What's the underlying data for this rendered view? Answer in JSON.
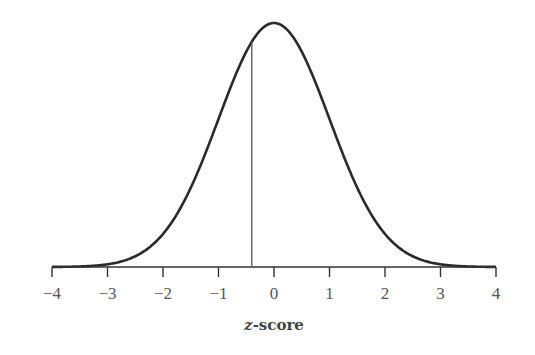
{
  "chart_data": {
    "type": "line",
    "title": "",
    "xlabel": "z-score",
    "ylabel": "",
    "xlim": [
      -4,
      4
    ],
    "x_ticks": [
      -4,
      -3,
      -2,
      -1,
      0,
      1,
      2,
      3,
      4
    ],
    "x_tick_labels": [
      "−4",
      "−3",
      "−2",
      "−1",
      "0",
      "1",
      "2",
      "3",
      "4"
    ],
    "series": [
      {
        "name": "Standard normal density",
        "function": "exp(-z^2/2)",
        "mean": 0,
        "sd": 1
      }
    ],
    "annotations": [
      {
        "type": "vertical_line",
        "x": -0.4,
        "from": "axis",
        "to": "curve"
      }
    ],
    "grid": false,
    "legend": null
  },
  "colors": {
    "curve": "#2a2a2a",
    "axis": "#333333",
    "marker_line": "#555555",
    "text": "#555555"
  }
}
